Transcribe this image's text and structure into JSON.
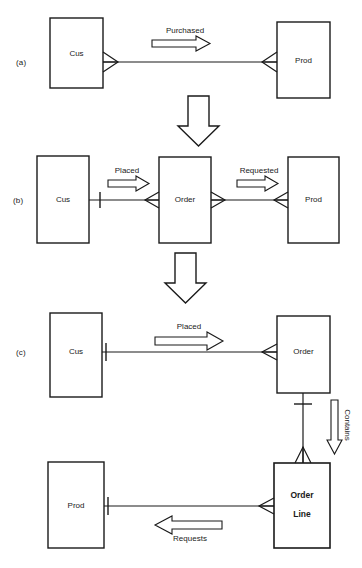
{
  "diagram": {
    "line_color": "#1a1a1a",
    "background_color": "#ffffff",
    "stages": [
      {
        "id": "a",
        "label": "(a)",
        "entities": [
          {
            "id": "cus-a",
            "name": "Cus"
          },
          {
            "id": "prod-a",
            "name": "Prod"
          }
        ],
        "relationships": [
          {
            "id": "purchased",
            "label": "Purchased",
            "direction": "right",
            "from": "Cus",
            "to": "Prod",
            "from_cardinality": "many",
            "to_cardinality": "many"
          }
        ]
      },
      {
        "id": "b",
        "label": "(b)",
        "entities": [
          {
            "id": "cus-b",
            "name": "Cus"
          },
          {
            "id": "order-b",
            "name": "Order"
          },
          {
            "id": "prod-b",
            "name": "Prod"
          }
        ],
        "relationships": [
          {
            "id": "placed-b",
            "label": "Placed",
            "direction": "right",
            "from": "Cus",
            "to": "Order",
            "from_cardinality": "one",
            "to_cardinality": "many"
          },
          {
            "id": "requested-b",
            "label": "Requested",
            "direction": "right",
            "from": "Order",
            "to": "Prod",
            "from_cardinality": "many",
            "to_cardinality": "many"
          }
        ]
      },
      {
        "id": "c",
        "label": "(c)",
        "entities": [
          {
            "id": "cus-c",
            "name": "Cus"
          },
          {
            "id": "order-c",
            "name": "Order"
          },
          {
            "id": "prod-c",
            "name": "Prod"
          },
          {
            "id": "orderline-c",
            "name": "Order\nLine"
          }
        ],
        "relationships": [
          {
            "id": "placed-c",
            "label": "Placed",
            "direction": "right",
            "from": "Cus",
            "to": "Order",
            "from_cardinality": "one",
            "to_cardinality": "many"
          },
          {
            "id": "contains-c",
            "label": "Contains",
            "direction": "down",
            "from": "Order",
            "to": "Order Line",
            "from_cardinality": "one",
            "to_cardinality": "many"
          },
          {
            "id": "requests-c",
            "label": "Requests",
            "direction": "left",
            "from": "Order Line",
            "to": "Prod",
            "from_cardinality": "many",
            "to_cardinality": "one"
          }
        ]
      }
    ],
    "transitions": [
      {
        "id": "transition-a-b",
        "direction": "down"
      },
      {
        "id": "transition-b-c",
        "direction": "down"
      }
    ]
  }
}
